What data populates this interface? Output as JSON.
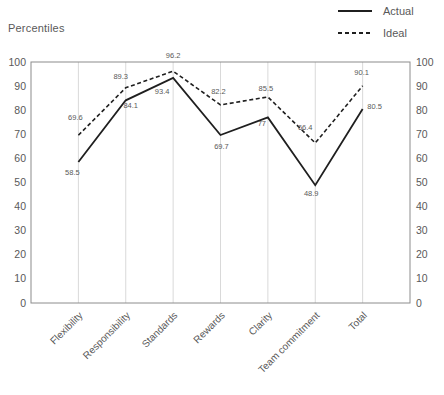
{
  "title": "Percentiles",
  "chart_data": {
    "type": "line",
    "categories": [
      "Flexibility",
      "Responsibility",
      "Standards",
      "Rewards",
      "Clarity",
      "Team commitment",
      "Total"
    ],
    "series": [
      {
        "name": "Actual",
        "style": "solid",
        "values": [
          58.5,
          84.1,
          93.4,
          69.7,
          77,
          48.9,
          80.5
        ],
        "label_offsets": [
          [
            -6,
            10
          ],
          [
            5,
            5
          ],
          [
            -11,
            14
          ],
          [
            1,
            11
          ],
          [
            -6,
            6
          ],
          [
            -4,
            8
          ],
          [
            12,
            -2
          ]
        ]
      },
      {
        "name": "Ideal",
        "style": "dashed",
        "values": [
          69.6,
          89.3,
          96.2,
          82.2,
          85.5,
          66.4,
          90.1
        ],
        "label_offsets": [
          [
            -3,
            -18
          ],
          [
            -5,
            -11
          ],
          [
            0,
            -16
          ],
          [
            -2,
            -13
          ],
          [
            -2,
            -8
          ],
          [
            -10,
            -15
          ],
          [
            -1,
            -13
          ]
        ]
      }
    ],
    "title": "Percentiles",
    "xlabel": "",
    "ylabel": "Percentiles",
    "ylim": [
      0,
      100
    ],
    "yticks": [
      0,
      10,
      20,
      30,
      40,
      50,
      60,
      70,
      80,
      90,
      100
    ],
    "grid": "vertical-only",
    "legend_position": "top-right",
    "y_axis_sides": "both",
    "colors": {
      "line": "#1f1f1f",
      "grid": "#d9d9d9",
      "border": "#8c8c8c",
      "axis_text": "#595959",
      "data_label_text": "#595959"
    }
  }
}
